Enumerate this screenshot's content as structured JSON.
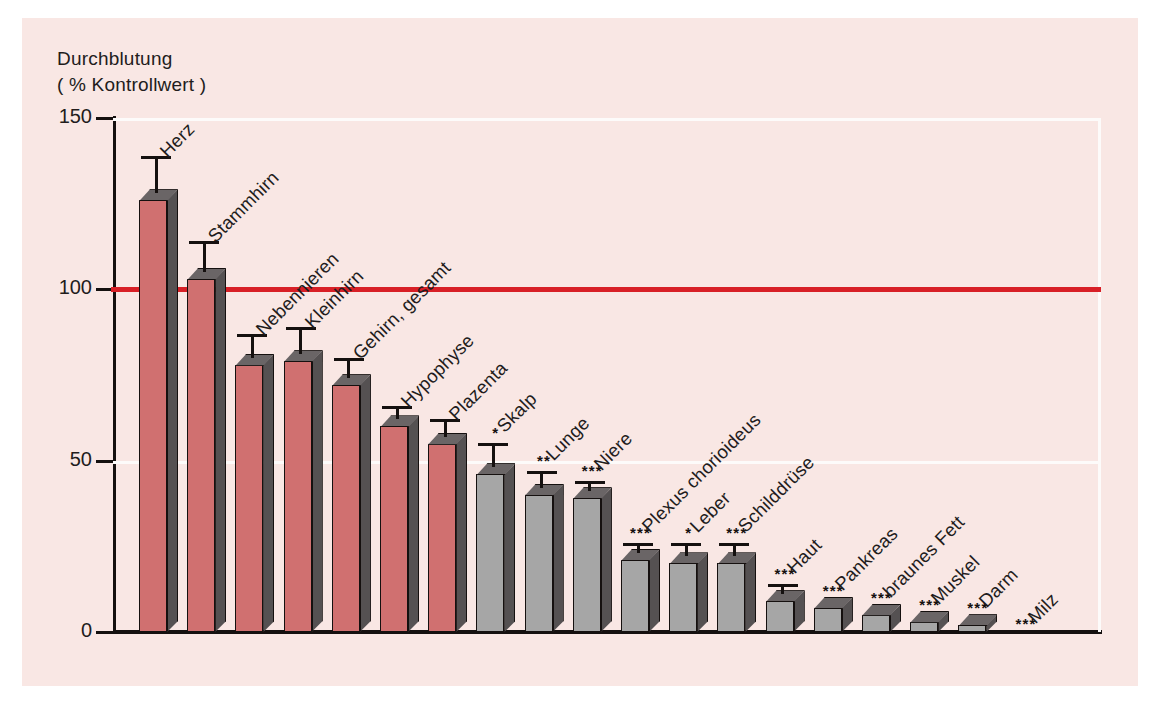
{
  "chart_data": {
    "type": "bar",
    "title": "",
    "ylabel": "Durchblutung ( % Kontrollwert )",
    "ylabel_line1": "Durchblutung",
    "ylabel_line2": "( % Kontrollwert )",
    "xlabel": "",
    "ylim": [
      0,
      150
    ],
    "yticks": [
      0,
      50,
      100,
      150
    ],
    "ytick_labels": [
      "0",
      "50",
      "100",
      "150"
    ],
    "grid": "horizontal white gridlines at 50 and 150",
    "legend": "none",
    "reference_line": {
      "value": 100,
      "color": "#d81f26",
      "label": "100 % Kontrollwert"
    },
    "annotations": "asterisks denote significance: * p<0.05, ** p<0.01, *** p<0.001",
    "categories": [
      "Herz",
      "Stammhirn",
      "Nebennieren",
      "Kleinhirn",
      "Gehirn, gesamt",
      "Hypophyse",
      "Plazenta",
      "Skalp",
      "Lunge",
      "Niere",
      "Plexus chorioideus",
      "Leber",
      "Schilddrüse",
      "Haut",
      "Pankreas",
      "braunes Fett",
      "Muskel",
      "Darm",
      "Milz"
    ],
    "values": [
      126,
      103,
      78,
      79,
      72,
      60,
      55,
      46,
      40,
      39,
      21,
      20,
      20,
      9,
      7,
      5,
      3,
      2,
      0
    ],
    "errors": [
      11,
      9,
      7,
      8,
      6,
      4,
      5,
      7,
      5,
      3,
      3,
      4,
      4,
      3,
      0,
      0,
      0,
      0,
      0
    ],
    "significance": [
      "",
      "",
      "",
      "",
      "",
      "",
      "",
      "*",
      "**",
      "***",
      "***",
      "*",
      "***",
      "***",
      "***",
      "***",
      "***",
      "***",
      "***"
    ],
    "bar_colors": [
      "#d07070",
      "#d07070",
      "#d07070",
      "#d07070",
      "#d07070",
      "#d07070",
      "#d07070",
      "#a6a6a6",
      "#a6a6a6",
      "#a6a6a6",
      "#a6a6a6",
      "#a6a6a6",
      "#a6a6a6",
      "#a6a6a6",
      "#a6a6a6",
      "#a6a6a6",
      "#a6a6a6",
      "#a6a6a6",
      "#a6a6a6"
    ],
    "colors": {
      "red_bar": "#d07070",
      "gray_bar": "#a6a6a6",
      "reference_line": "#d81f26",
      "axis": "#15100f",
      "gridline": "#fdfbfa",
      "background": "#f9e7e4",
      "page": "#ffffff"
    }
  }
}
